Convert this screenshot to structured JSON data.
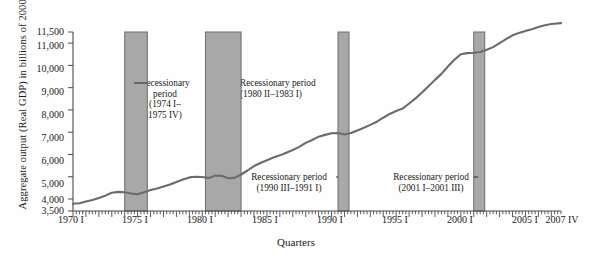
{
  "chart_data": {
    "type": "line",
    "title": "",
    "xlabel": "Quarters",
    "ylabel": "Aggregate output (Real GDP) in billions of 2000 dollars",
    "ylim": [
      3500,
      11500
    ],
    "grid": false,
    "legend": "none",
    "y_ticks": [
      "3,500",
      "4,000",
      "5,000",
      "6,000",
      "7,000",
      "8,000",
      "9,000",
      "10,000",
      "11,000",
      "11,500"
    ],
    "y_tick_values": [
      3500,
      4000,
      5000,
      6000,
      7000,
      8000,
      9000,
      10000,
      11000,
      11500
    ],
    "x_ticks": [
      "1970 I",
      "1975 I",
      "1980 I",
      "1985 I",
      "1990 I",
      "1995 I",
      "2000 I",
      "2005 I",
      "2007 IV"
    ],
    "x_tick_values": [
      1970.0,
      1975.0,
      1980.0,
      1985.0,
      1990.0,
      1995.0,
      2000.0,
      2005.0,
      2007.75
    ],
    "series": [
      {
        "name": "Real GDP",
        "x": [
          1970.0,
          1970.5,
          1971.0,
          1971.5,
          1972.0,
          1972.5,
          1973.0,
          1973.5,
          1974.0,
          1974.5,
          1975.0,
          1975.5,
          1976.0,
          1976.5,
          1977.0,
          1977.5,
          1978.0,
          1978.5,
          1979.0,
          1979.5,
          1980.0,
          1980.5,
          1981.0,
          1981.5,
          1982.0,
          1982.5,
          1983.0,
          1983.5,
          1984.0,
          1984.5,
          1985.0,
          1985.5,
          1986.0,
          1986.5,
          1987.0,
          1987.5,
          1988.0,
          1988.5,
          1989.0,
          1989.5,
          1990.0,
          1990.5,
          1991.0,
          1991.5,
          1992.0,
          1992.5,
          1993.0,
          1993.5,
          1994.0,
          1994.5,
          1995.0,
          1995.5,
          1996.0,
          1996.5,
          1997.0,
          1997.5,
          1998.0,
          1998.5,
          1999.0,
          1999.5,
          2000.0,
          2000.5,
          2001.0,
          2001.5,
          2002.0,
          2002.5,
          2003.0,
          2003.5,
          2004.0,
          2004.5,
          2005.0,
          2005.5,
          2006.0,
          2006.5,
          2007.0,
          2007.75
        ],
        "y": [
          3800,
          3820,
          3900,
          3960,
          4050,
          4150,
          4280,
          4320,
          4300,
          4250,
          4210,
          4300,
          4400,
          4470,
          4560,
          4650,
          4760,
          4880,
          4970,
          5000,
          4990,
          4940,
          5050,
          5040,
          4930,
          4950,
          5100,
          5280,
          5480,
          5620,
          5740,
          5860,
          5960,
          6080,
          6200,
          6340,
          6520,
          6650,
          6800,
          6880,
          6950,
          6960,
          6900,
          6960,
          7080,
          7200,
          7330,
          7470,
          7650,
          7820,
          7950,
          8060,
          8290,
          8520,
          8780,
          9060,
          9350,
          9620,
          9950,
          10250,
          10500,
          10550,
          10570,
          10600,
          10700,
          10820,
          11000,
          11180,
          11350,
          11460,
          11550,
          11620,
          11720,
          11800,
          11860,
          11900
        ]
      }
    ],
    "recession_bands": [
      {
        "id": "recession-1974",
        "label_line1": "Recessionary",
        "label_line2": "period",
        "label_line3": "(1974 I–",
        "label_line4": "1975 IV)",
        "start": 1974.0,
        "end": 1975.75,
        "range_text": "1974 I–1975 IV"
      },
      {
        "id": "recession-1980",
        "label_line1": "Recessionary period",
        "label_line2": "(1980 II–1983 I)",
        "start": 1980.25,
        "end": 1983.0,
        "range_text": "1980 II–1983 I"
      },
      {
        "id": "recession-1990",
        "label_line1": "Recessionary period",
        "label_line2": "(1990 III–1991 I)",
        "start": 1990.5,
        "end": 1991.0,
        "range_text": "1990 III–1991 I"
      },
      {
        "id": "recession-2001",
        "label_line1": "Recessionary period",
        "label_line2": "(2001 I–2001 III)",
        "start": 2001.0,
        "end": 2001.5,
        "range_text": "2001 I–2001 III"
      }
    ],
    "colors": {
      "line": "#6b6b6b",
      "band_fill": "#a8a8a8",
      "band_stroke": "#6d6d6d",
      "axis": "#4a4a4a",
      "text": "#1a1a1a"
    }
  }
}
